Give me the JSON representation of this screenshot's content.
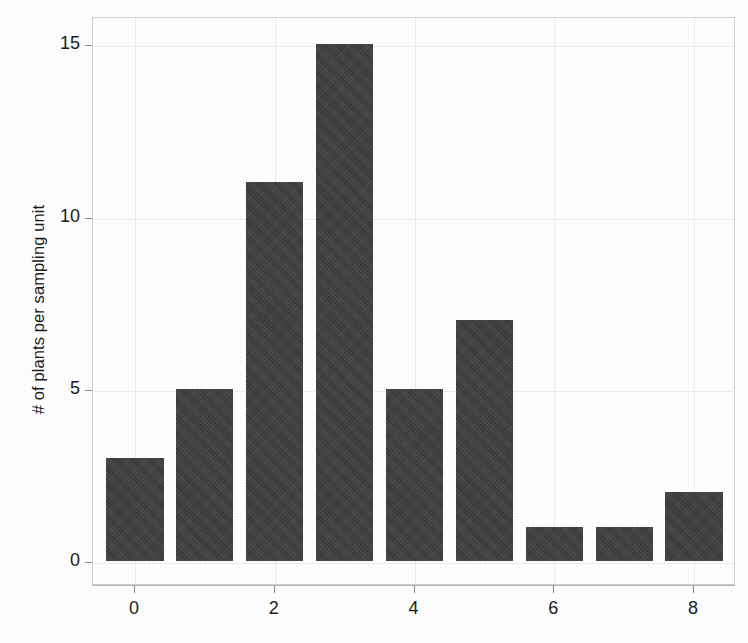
{
  "chart_data": {
    "type": "bar",
    "title": "",
    "subtitle": "",
    "xlabel": "",
    "ylabel": "# of plants per sampling unit",
    "categories": [
      "0",
      "1",
      "2",
      "3",
      "4",
      "5",
      "6",
      "7",
      "8"
    ],
    "x": [
      0,
      1,
      2,
      3,
      4,
      5,
      6,
      7,
      8
    ],
    "values": [
      3,
      5,
      11,
      15,
      5,
      7,
      1,
      1,
      2
    ],
    "series": [
      {
        "name": "frequency",
        "values": [
          3,
          5,
          11,
          15,
          5,
          7,
          1,
          1,
          2
        ]
      }
    ],
    "xlim": [
      -0.6,
      8.6
    ],
    "ylim": [
      0,
      15.8
    ],
    "yticks": [
      0,
      5,
      10,
      15
    ],
    "ytick_labels": [
      "0",
      "5",
      "10",
      "15"
    ],
    "xticks": [
      0,
      2,
      4,
      6,
      8
    ],
    "xtick_labels": [
      "0",
      "2",
      "4",
      "6",
      "8"
    ],
    "grid": true,
    "grid_axis": "both",
    "legend": false,
    "legend_position": "none",
    "bar_color": "#3f3f3f",
    "background_color": "#ffffff",
    "frame_color": "#cfcfcf",
    "annotations": []
  },
  "axes": {
    "y_title": "# of plants per sampling unit",
    "x_title": "",
    "y_tick_labels": [
      "15",
      "10",
      "5",
      "0"
    ],
    "x_tick_labels": [
      "0",
      "2",
      "4",
      "6",
      "8"
    ]
  },
  "colors": {
    "bar": "#3f3f3f",
    "grid": "#ececec",
    "frame": "#cfcfcf",
    "text": "#1b1b1b",
    "background": "#ffffff"
  }
}
